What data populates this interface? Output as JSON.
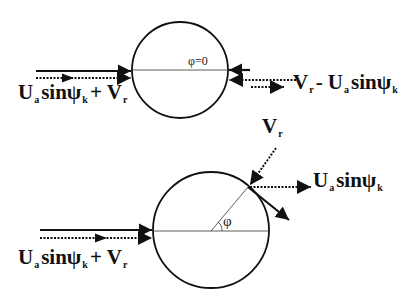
{
  "figure": {
    "type": "vector-diagram",
    "colors": {
      "stroke": "#111111",
      "background": "#ffffff"
    }
  },
  "top_panel": {
    "angle_label": "φ=0",
    "left_label": {
      "main1": "U",
      "sub1": "a",
      "main2": "sinψ",
      "sub2": "k",
      "main3": "+ V",
      "sub3": "r"
    },
    "right_label": {
      "main1": "V",
      "sub1": "r",
      "main2": "- U",
      "sub2": "a",
      "main3": "sinψ",
      "sub3": "k"
    }
  },
  "bottom_panel": {
    "angle_label": "φ",
    "left_label": {
      "main1": "U",
      "sub1": "a",
      "main2": "sinψ",
      "sub2": "k",
      "main3": "+ V",
      "sub3": "r"
    },
    "top_label": {
      "main1": "V",
      "sub1": "r"
    },
    "right_label": {
      "main1": "U",
      "sub1": "a",
      "main2": "sinψ",
      "sub2": "k"
    }
  }
}
